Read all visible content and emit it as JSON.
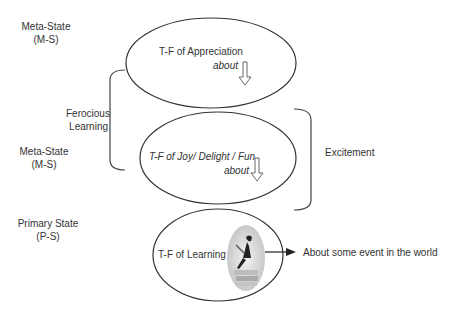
{
  "left_labels": [
    {
      "line1": "Meta-State",
      "line2": "(M-S)"
    },
    {
      "line1": "Meta-State",
      "line2": "(M-S)"
    },
    {
      "line1": "Primary State",
      "line2": "(P-S)"
    }
  ],
  "brackets": {
    "left": {
      "line1": "Ferocious",
      "line2": "Learning"
    },
    "right": {
      "label": "Excitement"
    }
  },
  "ellipses": [
    {
      "title": "T-F of Appreciation",
      "sub": "about",
      "title_italic": false
    },
    {
      "title": "T-F of Joy/ Delight / Fun",
      "sub": "about",
      "title_italic": true
    },
    {
      "title": "T-F of Learning"
    }
  ],
  "outcome": "About some event in the world",
  "colors": {
    "stroke": "#333333",
    "text": "#333333"
  }
}
